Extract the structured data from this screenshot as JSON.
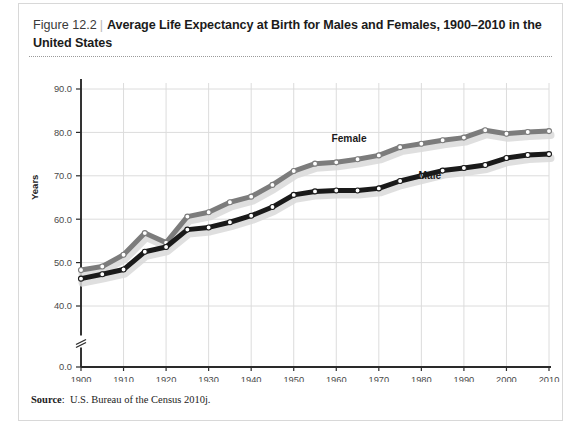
{
  "figure": {
    "number": "Figure 12.2",
    "divider": "|",
    "title": "Average Life Expectancy at Birth for Males and Females, 1900–2010 in the United States"
  },
  "source": {
    "label": "Source",
    "separator": ":",
    "text": "U.S. Bureau of the Census 2010j."
  },
  "colors": {
    "female_line": "#7c7c7c",
    "male_line": "#1a1a1a",
    "shadow": "#d9d9d9",
    "marker_fill": "#ffffff",
    "gridline": "#dcdcdc",
    "axis": "#2a2a2a",
    "frame_border": "#d8d8d8",
    "tick_label": "#4a4a4a"
  },
  "chart_data": {
    "type": "line",
    "title": "Average Life Expectancy at Birth for Males and Females, 1900–2010 in the United States",
    "xlabel": "",
    "ylabel": "Years",
    "xlim": [
      1900,
      2010
    ],
    "ylim": [
      38,
      92
    ],
    "grid": true,
    "axis_break": true,
    "axis_break_note": "y-axis broken between 0.0 and 40.0",
    "legend": "inline data labels",
    "ytick_labels": [
      "0.0",
      "40.0",
      "50.0",
      "60.0",
      "70.0",
      "80.0",
      "90.0"
    ],
    "ytick_values": [
      0.0,
      40.0,
      50.0,
      60.0,
      70.0,
      80.0,
      90.0
    ],
    "xtick_labels": [
      "1900",
      "1910",
      "1920",
      "1930",
      "1940",
      "1950",
      "1960",
      "1970",
      "1980",
      "1990",
      "2000",
      "2010"
    ],
    "xtick_values": [
      1900,
      1910,
      1920,
      1930,
      1940,
      1950,
      1960,
      1970,
      1980,
      1990,
      2000,
      2010
    ],
    "x": [
      1900,
      1905,
      1910,
      1915,
      1920,
      1925,
      1930,
      1935,
      1940,
      1945,
      1950,
      1955,
      1960,
      1965,
      1970,
      1975,
      1980,
      1985,
      1990,
      1995,
      2000,
      2005,
      2010
    ],
    "series": [
      {
        "name": "Female",
        "label": "Female",
        "color": "#7c7c7c",
        "values": [
          48.3,
          49.1,
          51.8,
          56.8,
          54.6,
          60.6,
          61.6,
          63.9,
          65.2,
          67.9,
          71.1,
          72.8,
          73.1,
          73.8,
          74.7,
          76.6,
          77.4,
          78.2,
          78.8,
          80.5,
          79.7,
          80.1,
          80.3
        ]
      },
      {
        "name": "Male",
        "label": "Male",
        "color": "#1a1a1a",
        "values": [
          46.3,
          47.3,
          48.4,
          52.5,
          53.6,
          57.6,
          58.1,
          59.3,
          60.8,
          62.8,
          65.6,
          66.4,
          66.6,
          66.6,
          67.1,
          68.8,
          70.0,
          71.2,
          71.8,
          72.5,
          74.1,
          74.8,
          75.0
        ]
      }
    ],
    "annotations": [
      {
        "text": "Female",
        "x": 1963,
        "y": 77.8
      },
      {
        "text": "Male",
        "x": 1982,
        "y": 69.3
      }
    ]
  }
}
